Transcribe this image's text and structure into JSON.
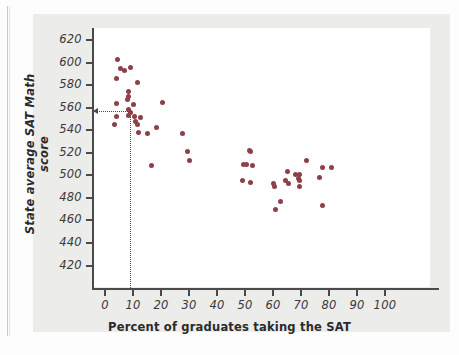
{
  "figure": {
    "background_color": "#ececea",
    "plot_background_color": "#ffffff",
    "point_color": "#8d4048",
    "axis_color": "#4a4a4a"
  },
  "chart_data": {
    "type": "scatter",
    "title": "",
    "xlabel": "Percent of graduates taking the SAT",
    "ylabel": "State average SAT Math score",
    "xlim": [
      -3,
      104
    ],
    "ylim": [
      418,
      628
    ],
    "xticks": [
      0,
      10,
      20,
      30,
      40,
      50,
      60,
      70,
      80,
      90,
      100
    ],
    "yticks": [
      420,
      440,
      460,
      480,
      500,
      520,
      540,
      560,
      580,
      600,
      620
    ],
    "grid": false,
    "legend": null,
    "annotations": {
      "guide_lines": {
        "style": "dotted",
        "x_value": 9,
        "y_value": 557,
        "description": "dotted reference lines from y-axis to highlighted point and down to x-axis"
      }
    },
    "points": [
      {
        "x": 4.5,
        "y": 603
      },
      {
        "x": 5.5,
        "y": 595
      },
      {
        "x": 7.0,
        "y": 593
      },
      {
        "x": 9.0,
        "y": 596
      },
      {
        "x": 4.0,
        "y": 586
      },
      {
        "x": 11.5,
        "y": 582
      },
      {
        "x": 8.5,
        "y": 574
      },
      {
        "x": 8.5,
        "y": 570
      },
      {
        "x": 8.0,
        "y": 567
      },
      {
        "x": 4.0,
        "y": 564
      },
      {
        "x": 10.0,
        "y": 563
      },
      {
        "x": 20.5,
        "y": 565
      },
      {
        "x": 8.5,
        "y": 558
      },
      {
        "x": 9.0,
        "y": 556
      },
      {
        "x": 8.5,
        "y": 553
      },
      {
        "x": 4.0,
        "y": 552
      },
      {
        "x": 10.5,
        "y": 552
      },
      {
        "x": 12.5,
        "y": 551
      },
      {
        "x": 3.5,
        "y": 545
      },
      {
        "x": 11.0,
        "y": 548
      },
      {
        "x": 11.5,
        "y": 545
      },
      {
        "x": 18.5,
        "y": 542
      },
      {
        "x": 12.0,
        "y": 538
      },
      {
        "x": 15.0,
        "y": 537
      },
      {
        "x": 27.5,
        "y": 537
      },
      {
        "x": 29.5,
        "y": 521
      },
      {
        "x": 30.0,
        "y": 513
      },
      {
        "x": 16.5,
        "y": 509
      },
      {
        "x": 49.5,
        "y": 510
      },
      {
        "x": 50.5,
        "y": 510
      },
      {
        "x": 51.5,
        "y": 522
      },
      {
        "x": 52.0,
        "y": 521
      },
      {
        "x": 52.5,
        "y": 509
      },
      {
        "x": 49.0,
        "y": 495
      },
      {
        "x": 52.0,
        "y": 494
      },
      {
        "x": 60.0,
        "y": 493
      },
      {
        "x": 60.5,
        "y": 490
      },
      {
        "x": 61.0,
        "y": 470
      },
      {
        "x": 62.5,
        "y": 477
      },
      {
        "x": 65.0,
        "y": 503
      },
      {
        "x": 64.5,
        "y": 495
      },
      {
        "x": 65.5,
        "y": 493
      },
      {
        "x": 68.0,
        "y": 501
      },
      {
        "x": 69.0,
        "y": 497
      },
      {
        "x": 69.5,
        "y": 501
      },
      {
        "x": 69.5,
        "y": 495
      },
      {
        "x": 69.5,
        "y": 490
      },
      {
        "x": 72.0,
        "y": 513
      },
      {
        "x": 76.5,
        "y": 498
      },
      {
        "x": 77.5,
        "y": 507
      },
      {
        "x": 81.0,
        "y": 507
      },
      {
        "x": 77.5,
        "y": 473
      }
    ]
  }
}
